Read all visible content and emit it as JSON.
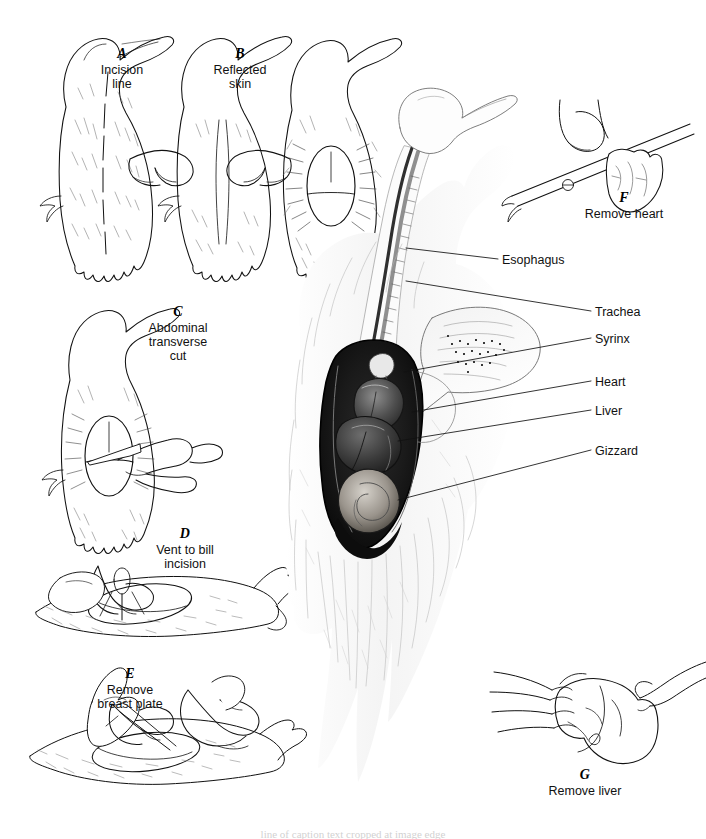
{
  "figure": {
    "type": "anatomical-illustration-plate",
    "background_color": "#ffffff",
    "ink_color": "#111111",
    "caption_bottom": "line of caption text cropped at image edge"
  },
  "panels": [
    {
      "id": "A",
      "letter": "A",
      "text": "Incision\nline",
      "letter_x": 122,
      "letter_y": 52,
      "text_x": 122,
      "text_y": 66
    },
    {
      "id": "B",
      "letter": "B",
      "text": "Reflected\nskin",
      "letter_x": 240,
      "letter_y": 52,
      "text_x": 240,
      "text_y": 66
    },
    {
      "id": "C",
      "letter": "C",
      "text": "Abdominal\ntransverse\ncut",
      "letter_x": 178,
      "letter_y": 310,
      "text_x": 178,
      "text_y": 324
    },
    {
      "id": "D",
      "letter": "D",
      "text": "Vent to bill\nincision",
      "letter_x": 185,
      "letter_y": 532,
      "text_x": 185,
      "text_y": 546
    },
    {
      "id": "E",
      "letter": "E",
      "text": "Remove\nbreast plate",
      "letter_x": 130,
      "letter_y": 672,
      "text_x": 130,
      "text_y": 686
    },
    {
      "id": "F",
      "letter": "F",
      "text": "Remove heart",
      "letter_x": 624,
      "letter_y": 196,
      "text_x": 624,
      "text_y": 210
    },
    {
      "id": "G",
      "letter": "G",
      "text": "Remove liver",
      "letter_x": 585,
      "letter_y": 773,
      "text_x": 585,
      "text_y": 787
    }
  ],
  "organ_labels": [
    {
      "name": "Esophagus",
      "text_x": 502,
      "text_y": 261,
      "leader": {
        "x1": 498,
        "y1": 259,
        "x2": 406,
        "y2": 248
      }
    },
    {
      "name": "Trachea",
      "text_x": 595,
      "text_y": 313,
      "leader": {
        "x1": 591,
        "y1": 311,
        "x2": 406,
        "y2": 281
      }
    },
    {
      "name": "Syrinx",
      "text_x": 595,
      "text_y": 340,
      "leader": {
        "x1": 591,
        "y1": 338,
        "x2": 404,
        "y2": 372
      }
    },
    {
      "name": "Heart",
      "text_x": 595,
      "text_y": 383,
      "leader": {
        "x1": 591,
        "y1": 381,
        "x2": 412,
        "y2": 412
      }
    },
    {
      "name": "Liver",
      "text_x": 595,
      "text_y": 412,
      "leader": {
        "x1": 591,
        "y1": 410,
        "x2": 398,
        "y2": 441
      }
    },
    {
      "name": "Gizzard",
      "text_x": 595,
      "text_y": 452,
      "leader": {
        "x1": 591,
        "y1": 450,
        "x2": 398,
        "y2": 500
      }
    }
  ],
  "illustrations": {
    "panel_a": "duck carcass on back, dashed midline incision line",
    "panel_b": "two hands parting skin at midline of duck carcass",
    "panel_b2": "duck carcass with skin reflected, oval opening exposed",
    "panel_c": "hand with scalpel making abdominal transverse cut through oval opening",
    "panel_d": "hand with scissors making vent-to-bill incision on bird lying on side",
    "panel_e": "two hands, one with scissors, removing the breast plate",
    "panel_f": "forceps and fingers lifting the removed heart",
    "panel_g": "two hands holding the removed liver lobes",
    "center": "large shaded specimen: opened body cavity of duck showing esophagus, trachea, syrinx, heart, liver and gizzard"
  }
}
